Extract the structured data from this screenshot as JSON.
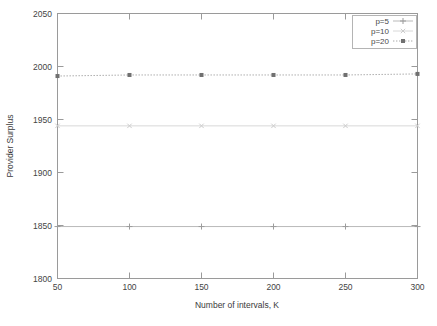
{
  "chart_data": {
    "type": "line",
    "title": "",
    "xlabel": "Number of intervals, K",
    "ylabel": "Provider Surplus",
    "x": [
      50,
      100,
      150,
      200,
      250,
      300
    ],
    "xlim": [
      50,
      300
    ],
    "ylim": [
      1800,
      2050
    ],
    "xticks": [
      "50",
      "100",
      "150",
      "200",
      "250",
      "300"
    ],
    "yticks": [
      "1800",
      "1850",
      "1900",
      "1950",
      "2000",
      "2050"
    ],
    "grid": false,
    "legend_position": "top-right-inside",
    "series": [
      {
        "name": "p=5",
        "marker": "plus",
        "linestyle": "solid",
        "color": "#b9b9b9",
        "values": [
          1849,
          1849,
          1849,
          1849,
          1849,
          1849
        ]
      },
      {
        "name": "p=10",
        "marker": "cross",
        "linestyle": "solid-faint",
        "color": "#d8d8d8",
        "values": [
          1944,
          1944,
          1944,
          1944,
          1944,
          1944
        ]
      },
      {
        "name": "p=20",
        "marker": "filled-square",
        "linestyle": "dotted",
        "color": "#a8a8a8",
        "values": [
          1991,
          1992,
          1992,
          1992,
          1992,
          1993
        ]
      }
    ]
  },
  "legend": {
    "entries": [
      {
        "label": "p=5"
      },
      {
        "label": "p=10"
      },
      {
        "label": "p=20"
      }
    ]
  },
  "axes": {
    "x_title": "Number of intervals, K",
    "y_title": "Provider Surplus",
    "x_tick_labels": [
      "50",
      "100",
      "150",
      "200",
      "250",
      "300"
    ],
    "y_tick_labels": [
      "1800",
      "1850",
      "1900",
      "1950",
      "2000",
      "2050"
    ]
  }
}
